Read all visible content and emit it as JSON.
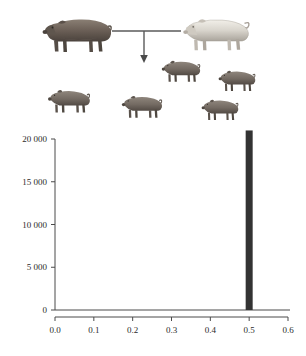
{
  "figure": {
    "pedigree": {
      "name": "pig-crossing-diagram",
      "cross_symbol": "horizontal-line-with-down-arrow",
      "parents": [
        {
          "id": "sire",
          "label": "dark-parent-pig",
          "coat": "dark-brown-gray",
          "color": "#6e6259",
          "facing": "left"
        },
        {
          "id": "dam",
          "label": "light-parent-pig",
          "coat": "white-cream",
          "color": "#d8d4cc",
          "facing": "left"
        }
      ],
      "offspring_count": 5,
      "offspring": [
        {
          "id": "f1-1",
          "label": "piglet-1",
          "color": "#7a7069",
          "facing": "left"
        },
        {
          "id": "f1-2",
          "label": "piglet-2",
          "color": "#7a7069",
          "facing": "left"
        },
        {
          "id": "f1-3",
          "label": "piglet-3",
          "color": "#7a7069",
          "facing": "left"
        },
        {
          "id": "f1-4",
          "label": "piglet-4",
          "color": "#7a7069",
          "facing": "left"
        },
        {
          "id": "f1-5",
          "label": "piglet-5",
          "color": "#7a7069",
          "facing": "left"
        }
      ]
    }
  },
  "chart_data": {
    "type": "bar",
    "title": "",
    "xlabel": "",
    "ylabel": "",
    "xlim": [
      0.0,
      0.6
    ],
    "ylim": [
      0,
      20000
    ],
    "grid": false,
    "legend": null,
    "bar_color": "#333333",
    "x": [
      0.5
    ],
    "values": [
      21000
    ],
    "categories": [
      "0.5"
    ],
    "xticks": [
      0.0,
      0.1,
      0.2,
      0.3,
      0.4,
      0.5,
      0.6
    ],
    "xticklabels": [
      "0.0",
      "0.1",
      "0.2",
      "0.3",
      "0.4",
      "0.5",
      "0.6"
    ],
    "yticks": [
      0,
      5000,
      10000,
      15000,
      20000
    ],
    "yticklabels": [
      "0",
      "5 000",
      "10 000",
      "15 000",
      "20 000"
    ]
  }
}
